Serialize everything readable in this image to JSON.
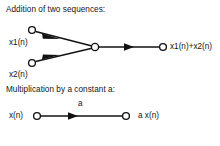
{
  "page": {
    "width": 220,
    "height": 146,
    "background_color": "#ffffff",
    "ink_color": "#121212"
  },
  "sections": {
    "addition": {
      "heading": "Addition of two sequences:",
      "inputs": [
        {
          "label": "x1(n)",
          "node_name": "input-node-x1"
        },
        {
          "label": "x2(n)",
          "node_name": "input-node-x2"
        }
      ],
      "junction_name": "summing-junction-node",
      "output": {
        "label": "x1(n)+x2(n)",
        "node_name": "output-node-sum"
      }
    },
    "multiplication": {
      "heading": "Multiplication by a constant a:",
      "input": {
        "label": "x(n)",
        "node_name": "input-node-x"
      },
      "gain_label": "a",
      "output": {
        "label": "a x(n)",
        "node_name": "output-node-ax"
      }
    }
  },
  "geometry": {
    "addition": {
      "x1_node": {
        "cx": 32,
        "cy": 30,
        "r": 3.4
      },
      "x2_node": {
        "cx": 32,
        "cy": 63,
        "r": 3.4
      },
      "junction_node": {
        "cx": 95,
        "cy": 47,
        "r": 3.6
      },
      "output_node": {
        "cx": 163,
        "cy": 47,
        "r": 3.4
      },
      "branch_top": "M35.6,31.6 L92.0,46.0",
      "branch_bottom": "M35.6,61.4 L92.0,48.2",
      "trunk": "M98.6,47 L159.6,47",
      "arrow_top": "M42,33.5 L60,39.0 L42.9,38.7 Z",
      "arrow_bottom": "M42,59.5 L60,55.0 L42.9,54.4 Z",
      "arrow_trunk": "M124,43.2 L134,47 L124,50.8 Z"
    },
    "multiplication": {
      "input_node": {
        "cx": 37,
        "cy": 116,
        "r": 3.4
      },
      "output_node": {
        "cx": 126,
        "cy": 116,
        "r": 3.4
      },
      "wire": "M40.6,116 L122.6,116",
      "arrow": "M68,112.2 L78,116 L68,119.8 Z"
    }
  }
}
